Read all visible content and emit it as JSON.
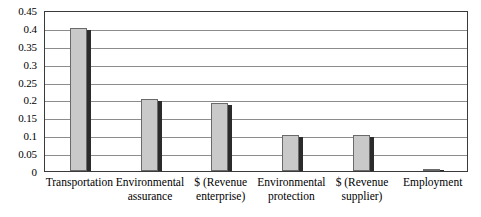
{
  "chart_data": {
    "type": "bar",
    "title": "",
    "subtitle": "",
    "xlabel": "",
    "ylabel": "",
    "categories": [
      "Transportation",
      "Environmental assurance",
      "$ (Revenue enterprise)",
      "Environmental protection",
      "$ (Revenue supplier)",
      "Employment"
    ],
    "values": [
      0.4,
      0.2,
      0.19,
      0.1,
      0.1,
      0.005
    ],
    "ylim": [
      0,
      0.45
    ],
    "ytick_values": [
      0,
      0.05,
      0.1,
      0.15,
      0.2,
      0.25,
      0.3,
      0.35,
      0.4,
      0.45
    ],
    "ytick_labels": [
      "0",
      "0.05",
      "0.1",
      "0.15",
      "0.2",
      "0.25",
      "0.3",
      "0.35",
      "0.4",
      "0.45"
    ],
    "grid": "horizontal",
    "legend": "none",
    "series": [
      {
        "name": "",
        "values": [
          0.4,
          0.2,
          0.19,
          0.1,
          0.1,
          0.005
        ]
      }
    ]
  },
  "style": {
    "bar_fill": "#c9c9c9",
    "bar_border": "#6a6a6a",
    "bar_shadow": "#2b2b2b",
    "gridline_color": "#8c8c8c",
    "axis_color": "#3a3a3a",
    "background": "#ffffff",
    "text_color": "#000000"
  }
}
